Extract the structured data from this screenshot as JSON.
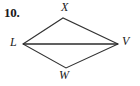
{
  "figure": {
    "problem_number": "10.",
    "background_color": "#ffffff",
    "stroke_color": "#333333",
    "diagonal_color": "#2b2b2b",
    "shape_name": "kite-LXVW",
    "vertices": [
      {
        "label": "X",
        "name": "vertex-x",
        "x": 63,
        "y": 18
      },
      {
        "label": "V",
        "name": "vertex-v",
        "x": 118,
        "y": 44
      },
      {
        "label": "W",
        "name": "vertex-w",
        "x": 66,
        "y": 68
      },
      {
        "label": "L",
        "name": "vertex-l",
        "x": 23,
        "y": 44
      }
    ],
    "edges": [
      {
        "name": "edge-LX",
        "from": "L",
        "to": "X"
      },
      {
        "name": "edge-XV",
        "from": "X",
        "to": "V"
      },
      {
        "name": "edge-VW",
        "from": "V",
        "to": "W"
      },
      {
        "name": "edge-WL",
        "from": "W",
        "to": "L"
      }
    ],
    "diagonals": [
      {
        "name": "diagonal-LV",
        "from": "L",
        "to": "V"
      }
    ]
  }
}
